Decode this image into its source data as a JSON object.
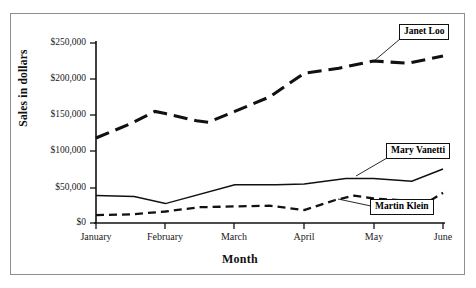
{
  "chart_data": {
    "type": "line",
    "title": "",
    "xlabel": "Month",
    "ylabel": "Sales in dollars",
    "categories": [
      "January",
      "February",
      "March",
      "April",
      "May",
      "June"
    ],
    "x_tick_labels": [
      "January",
      "February",
      "March",
      "April",
      "May",
      "June"
    ],
    "y_tick_labels": [
      "$0",
      "$50,000",
      "$100,000",
      "$150,000",
      "$200,000",
      "$250,000"
    ],
    "y_tick_values": [
      0,
      50000,
      100000,
      150000,
      200000,
      250000
    ],
    "ylim": [
      0,
      250000
    ],
    "grid": false,
    "legend_position": "inline-callouts",
    "series": [
      {
        "name": "Janet Loo",
        "style": "long-dashed",
        "line_width": 3.1,
        "color": "#111111",
        "values": [
          118000,
          155000,
          140000,
          208000,
          225000,
          232000
        ],
        "detail_points": [
          {
            "x": 0.0,
            "y": 118000
          },
          {
            "x": 0.5,
            "y": 138000
          },
          {
            "x": 0.85,
            "y": 155000
          },
          {
            "x": 1.0,
            "y": 152000
          },
          {
            "x": 1.45,
            "y": 142000
          },
          {
            "x": 1.62,
            "y": 140000
          },
          {
            "x": 2.0,
            "y": 155000
          },
          {
            "x": 2.5,
            "y": 175000
          },
          {
            "x": 3.0,
            "y": 208000
          },
          {
            "x": 3.5,
            "y": 215000
          },
          {
            "x": 4.0,
            "y": 225000
          },
          {
            "x": 4.5,
            "y": 222000
          },
          {
            "x": 5.0,
            "y": 232000
          }
        ]
      },
      {
        "name": "Mary Vanetti",
        "style": "solid",
        "line_width": 1.5,
        "color": "#111111",
        "values": [
          38000,
          27000,
          53000,
          55000,
          58000,
          75000
        ],
        "detail_points": [
          {
            "x": 0.0,
            "y": 38000
          },
          {
            "x": 0.55,
            "y": 37000
          },
          {
            "x": 1.0,
            "y": 27000
          },
          {
            "x": 2.0,
            "y": 53000
          },
          {
            "x": 2.6,
            "y": 53000
          },
          {
            "x": 3.0,
            "y": 54000
          },
          {
            "x": 3.6,
            "y": 62000
          },
          {
            "x": 4.0,
            "y": 62000
          },
          {
            "x": 4.55,
            "y": 58000
          },
          {
            "x": 5.0,
            "y": 75000
          }
        ]
      },
      {
        "name": "Martin Klein",
        "style": "dashed",
        "line_width": 2.3,
        "color": "#111111",
        "values": [
          11000,
          16000,
          23000,
          18000,
          33000,
          42000
        ],
        "detail_points": [
          {
            "x": 0.0,
            "y": 11000
          },
          {
            "x": 0.5,
            "y": 12000
          },
          {
            "x": 1.0,
            "y": 16000
          },
          {
            "x": 1.5,
            "y": 22000
          },
          {
            "x": 2.0,
            "y": 23000
          },
          {
            "x": 2.5,
            "y": 24000
          },
          {
            "x": 3.0,
            "y": 18000
          },
          {
            "x": 3.45,
            "y": 32000
          },
          {
            "x": 3.72,
            "y": 38000
          },
          {
            "x": 4.0,
            "y": 34000
          },
          {
            "x": 4.5,
            "y": 31000
          },
          {
            "x": 4.78,
            "y": 29000
          },
          {
            "x": 5.0,
            "y": 42000
          }
        ]
      }
    ],
    "annotations": [
      {
        "label": "Janet Loo",
        "anchor_series": "Janet Loo"
      },
      {
        "label": "Mary Vanetti",
        "anchor_series": "Mary Vanetti"
      },
      {
        "label": "Martin Klein",
        "anchor_series": "Martin Klein"
      }
    ]
  },
  "axis": {
    "y_title": "Sales in dollars",
    "x_title": "Month"
  },
  "ticks": {
    "y": [
      {
        "label": "$250,000"
      },
      {
        "label": "$200,000"
      },
      {
        "label": "$150,000"
      },
      {
        "label": "$100,000"
      },
      {
        "label": "$50,000"
      },
      {
        "label": "$0"
      }
    ],
    "x": [
      {
        "label": "January"
      },
      {
        "label": "February"
      },
      {
        "label": "March"
      },
      {
        "label": "April"
      },
      {
        "label": "May"
      },
      {
        "label": "June"
      }
    ]
  },
  "callouts": {
    "janet": "Janet Loo",
    "mary": "Mary Vanetti",
    "martin": "Martin Klein"
  }
}
